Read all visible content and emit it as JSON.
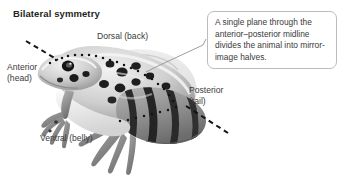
{
  "figure": {
    "title": "Bilateral symmetry",
    "background_color": "#ffffff",
    "text_color": "#3b3b3b",
    "title_color": "#231f20"
  },
  "callout": {
    "text": "A single plane through the anterior–posterior midline divides the animal into mirror-image halves.",
    "border_color": "#b9bcbe",
    "fill_color": "#ffffff"
  },
  "labels": {
    "dorsal": "Dorsal (back)",
    "anterior_line1": "Anterior",
    "anterior_line2": "(head)",
    "posterior_line1": "Posterior",
    "posterior_line2": "(tail)",
    "ventral": "Ventral (belly)"
  },
  "illustration": {
    "subject": "leopard-frog",
    "rendering": "grayscale-photograph",
    "symmetry_plane": "dashed-line-anterior-to-posterior",
    "dash_color": "#1a1a1a",
    "leader_line_color": "#8e9295"
  }
}
